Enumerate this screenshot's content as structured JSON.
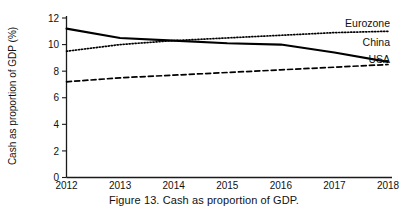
{
  "caption": "Figure 13.  Cash as proportion of GDP.",
  "chart_data": {
    "type": "line",
    "title": "",
    "xlabel": "",
    "ylabel": "Cash as proportion of GDP (%)",
    "x": [
      2012,
      2013,
      2014,
      2015,
      2016,
      2017,
      2018
    ],
    "categories": [
      "2012",
      "2013",
      "2014",
      "2015",
      "2016",
      "2017",
      "2018"
    ],
    "xlim": [
      2012,
      2018
    ],
    "ylim": [
      0,
      12
    ],
    "yticks": [
      0,
      2,
      4,
      6,
      8,
      10,
      12
    ],
    "ytick_labels": [
      "0",
      "2",
      "4",
      "6",
      "8",
      "10",
      "12"
    ],
    "xticks": [
      2012,
      2013,
      2014,
      2015,
      2016,
      2017,
      2018
    ],
    "xtick_labels": [
      "2012",
      "2013",
      "2014",
      "2015",
      "2016",
      "2017",
      "2018"
    ],
    "grid": false,
    "legend_position": "inline-right",
    "series": [
      {
        "name": "China",
        "style": "solid",
        "color": "#000000",
        "values": [
          11.2,
          10.5,
          10.3,
          10.1,
          10.0,
          9.4,
          8.7
        ]
      },
      {
        "name": "Eurozone",
        "style": "dotted",
        "color": "#000000",
        "values": [
          9.5,
          10.0,
          10.3,
          10.5,
          10.7,
          10.9,
          11.0
        ]
      },
      {
        "name": "USA",
        "style": "dashed",
        "color": "#000000",
        "values": [
          7.2,
          7.5,
          7.7,
          7.9,
          8.1,
          8.3,
          8.5
        ]
      }
    ],
    "series_labels": [
      {
        "name": "Eurozone",
        "value": 11.0
      },
      {
        "name": "China",
        "value": 9.6
      },
      {
        "name": "USA",
        "value": 8.3
      }
    ]
  }
}
